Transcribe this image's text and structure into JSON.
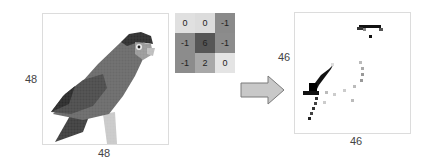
{
  "input_image": {
    "subject": "parrot (grayscale, pixelated)",
    "height_label": "48",
    "width_label": "48"
  },
  "kernel": {
    "cells": [
      {
        "value": "0",
        "color": "#e0e0e0"
      },
      {
        "value": "0",
        "color": "#dcdcdc"
      },
      {
        "value": "-1",
        "color": "#8a8a8a"
      },
      {
        "value": "-1",
        "color": "#8c8c8c"
      },
      {
        "value": "6",
        "color": "#565656"
      },
      {
        "value": "-1",
        "color": "#8c8c8c"
      },
      {
        "value": "-1",
        "color": "#8c8c8c"
      },
      {
        "value": "2",
        "color": "#a8a8a8"
      },
      {
        "value": "0",
        "color": "#e4e4e4"
      }
    ]
  },
  "arrow": {
    "fill": "#c8c8c8",
    "stroke": "#7a7a7a"
  },
  "output_image": {
    "subject": "convolution result (edge map)",
    "height_label": "46",
    "width_label": "46"
  }
}
